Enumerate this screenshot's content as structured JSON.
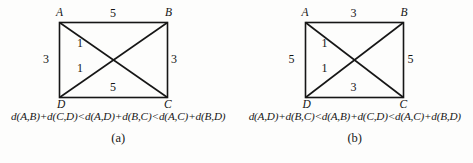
{
  "figure": {
    "background_color": "#fdfdfc",
    "line_color": "#161616",
    "panels": [
      {
        "id": "a",
        "caption": "(a)",
        "formula": "d(A,B)+d(C,D)<d(A,D)+d(B,C)<d(A,C)+d(B,D)",
        "vertices": {
          "top_left": "A",
          "top_right": "B",
          "bottom_right": "C",
          "bottom_left": "D"
        },
        "edge_labels": {
          "top": "5",
          "left": "3",
          "right": "3",
          "bottom": "5",
          "diagonal_upper": "1",
          "diagonal_lower": "1"
        }
      },
      {
        "id": "b",
        "caption": "(b)",
        "formula": "d(A,D)+d(B,C)<d(A,B)+d(C,D)<d(A,C)+d(B,D)",
        "vertices": {
          "top_left": "A",
          "top_right": "B",
          "bottom_right": "C",
          "bottom_left": "D"
        },
        "edge_labels": {
          "top": "3",
          "left": "5",
          "right": "5",
          "bottom": "3",
          "diagonal_upper": "1",
          "diagonal_lower": "1"
        }
      }
    ]
  }
}
